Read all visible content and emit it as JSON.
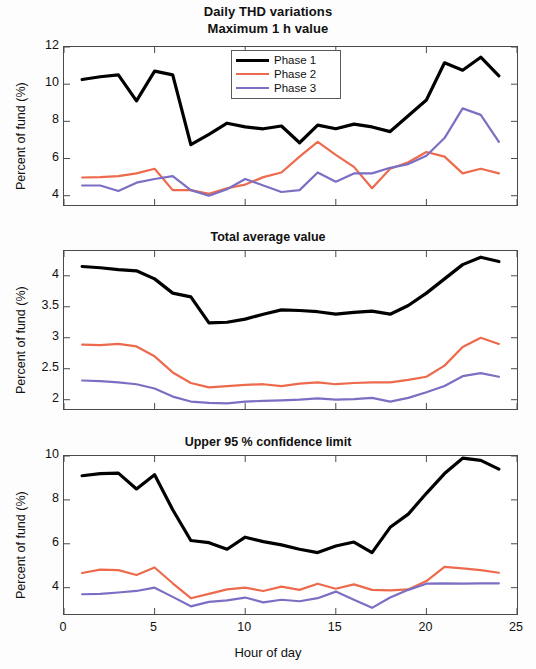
{
  "figure": {
    "supertitle_line1": "Daily THD variations",
    "supertitle_line2": "Maximum 1 h value",
    "xlabel": "Hour of day",
    "ylabel": "Percent of fund (%)"
  },
  "legend": {
    "items": [
      {
        "label": "Phase 1",
        "color": "#000000"
      },
      {
        "label": "Phase 2",
        "color": "#ED6A4C"
      },
      {
        "label": "Phase 3",
        "color": "#7B6FC4"
      }
    ]
  },
  "colors": {
    "phase1": "#000000",
    "phase2": "#ED6A4C",
    "phase3": "#7B6FC4",
    "axis": "#4a4a4a",
    "background": "#ffffff"
  },
  "chart_data": [
    {
      "type": "line",
      "title": "Maximum 1 h value",
      "xlabel": "",
      "ylabel": "Percent of fund (%)",
      "xlim": [
        0,
        25
      ],
      "ylim": [
        3.5,
        12
      ],
      "xticks": [
        0,
        5,
        10,
        15,
        20,
        25
      ],
      "yticks": [
        4,
        6,
        8,
        10,
        12
      ],
      "grid": false,
      "legend_position": "top-center",
      "x": [
        1,
        2,
        3,
        4,
        5,
        6,
        7,
        8,
        9,
        10,
        11,
        12,
        13,
        14,
        15,
        16,
        17,
        18,
        19,
        20,
        21,
        22,
        23,
        24
      ],
      "series": [
        {
          "name": "Phase 1",
          "color": "#000000",
          "values": [
            10.25,
            10.4,
            10.5,
            9.1,
            10.7,
            10.5,
            6.75,
            7.3,
            7.9,
            7.7,
            7.6,
            7.75,
            6.85,
            7.8,
            7.6,
            7.85,
            7.7,
            7.45,
            8.3,
            9.15,
            11.15,
            10.75,
            11.45,
            10.45
          ]
        },
        {
          "name": "Phase 2",
          "color": "#ED6A4C",
          "values": [
            4.98,
            5.0,
            5.05,
            5.2,
            5.45,
            4.3,
            4.3,
            4.1,
            4.4,
            4.6,
            5.0,
            5.25,
            6.1,
            6.9,
            6.2,
            5.55,
            4.4,
            5.45,
            5.8,
            6.35,
            6.1,
            5.2,
            5.45,
            5.2
          ]
        },
        {
          "name": "Phase 3",
          "color": "#7B6FC4",
          "values": [
            4.55,
            4.55,
            4.25,
            4.7,
            4.9,
            5.05,
            4.3,
            4.0,
            4.35,
            4.9,
            4.55,
            4.2,
            4.3,
            5.25,
            4.75,
            5.2,
            5.2,
            5.5,
            5.7,
            6.15,
            7.1,
            8.7,
            8.35,
            6.9
          ]
        }
      ]
    },
    {
      "type": "line",
      "title": "Total average value",
      "xlabel": "",
      "ylabel": "Percent of fund (%)",
      "xlim": [
        0,
        25
      ],
      "ylim": [
        1.85,
        4.4
      ],
      "xticks": [
        0,
        5,
        10,
        15,
        20,
        25
      ],
      "yticks": [
        2,
        2.5,
        3,
        3.5,
        4
      ],
      "grid": false,
      "legend_position": "none",
      "x": [
        1,
        2,
        3,
        4,
        5,
        6,
        7,
        8,
        9,
        10,
        11,
        12,
        13,
        14,
        15,
        16,
        17,
        18,
        19,
        20,
        21,
        22,
        23,
        24
      ],
      "series": [
        {
          "name": "Phase 1",
          "color": "#000000",
          "values": [
            4.15,
            4.13,
            4.1,
            4.08,
            3.95,
            3.72,
            3.66,
            3.24,
            3.25,
            3.3,
            3.38,
            3.45,
            3.44,
            3.42,
            3.38,
            3.41,
            3.43,
            3.38,
            3.52,
            3.72,
            3.95,
            4.18,
            4.3,
            4.23
          ]
        },
        {
          "name": "Phase 2",
          "color": "#ED6A4C",
          "values": [
            2.89,
            2.88,
            2.9,
            2.86,
            2.7,
            2.44,
            2.27,
            2.2,
            2.22,
            2.24,
            2.25,
            2.22,
            2.26,
            2.28,
            2.25,
            2.27,
            2.28,
            2.28,
            2.32,
            2.37,
            2.55,
            2.85,
            3.0,
            2.9
          ]
        },
        {
          "name": "Phase 3",
          "color": "#7B6FC4",
          "values": [
            2.31,
            2.3,
            2.28,
            2.25,
            2.18,
            2.05,
            1.97,
            1.95,
            1.94,
            1.97,
            1.98,
            1.99,
            2.0,
            2.02,
            2.0,
            2.01,
            2.03,
            1.97,
            2.03,
            2.12,
            2.22,
            2.38,
            2.43,
            2.37
          ]
        }
      ]
    },
    {
      "type": "line",
      "title": "Upper 95 % confidence limit",
      "xlabel": "Hour of day",
      "ylabel": "Percent of fund (%)",
      "xlim": [
        0,
        25
      ],
      "ylim": [
        2.8,
        10
      ],
      "xticks": [
        0,
        5,
        10,
        15,
        20,
        25
      ],
      "yticks": [
        4,
        6,
        8,
        10
      ],
      "grid": false,
      "legend_position": "none",
      "x": [
        1,
        2,
        3,
        4,
        5,
        6,
        7,
        8,
        9,
        10,
        11,
        12,
        13,
        14,
        15,
        16,
        17,
        18,
        19,
        20,
        21,
        22,
        23,
        24
      ],
      "series": [
        {
          "name": "Phase 1",
          "color": "#000000",
          "values": [
            9.1,
            9.2,
            9.22,
            8.5,
            9.15,
            7.55,
            6.15,
            6.05,
            5.75,
            6.3,
            6.1,
            5.95,
            5.75,
            5.6,
            5.9,
            6.08,
            5.6,
            6.75,
            7.35,
            8.3,
            9.2,
            9.9,
            9.8,
            9.4
          ]
        },
        {
          "name": "Phase 2",
          "color": "#ED6A4C",
          "values": [
            4.67,
            4.82,
            4.8,
            4.58,
            4.92,
            4.2,
            3.52,
            3.72,
            3.92,
            4.0,
            3.85,
            4.05,
            3.9,
            4.18,
            3.95,
            4.15,
            3.9,
            3.88,
            3.92,
            4.3,
            4.95,
            4.88,
            4.8,
            4.68
          ]
        },
        {
          "name": "Phase 3",
          "color": "#7B6FC4",
          "values": [
            3.7,
            3.72,
            3.78,
            3.85,
            4.0,
            3.58,
            3.15,
            3.35,
            3.42,
            3.55,
            3.33,
            3.45,
            3.38,
            3.52,
            3.82,
            3.45,
            3.08,
            3.55,
            3.9,
            4.18,
            4.2,
            4.18,
            4.2,
            4.2
          ]
        }
      ]
    }
  ]
}
